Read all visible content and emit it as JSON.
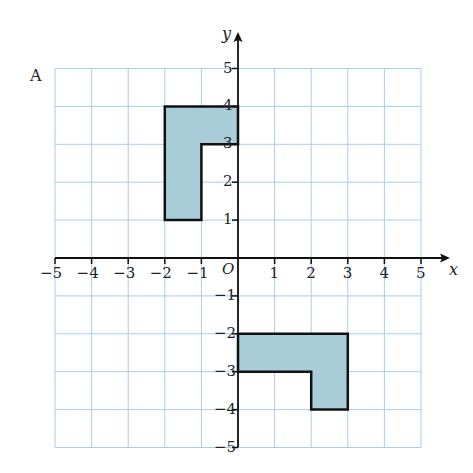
{
  "figure_label": "A",
  "axes": {
    "x_label": "x",
    "y_label": "y",
    "origin_label": "O",
    "x_ticks": [
      "−5",
      "−4",
      "−3",
      "−2",
      "−1",
      "1",
      "2",
      "3",
      "4",
      "5"
    ],
    "y_ticks": [
      "5",
      "4",
      "3",
      "2",
      "1",
      "−1",
      "−2",
      "−3",
      "−4",
      "−5"
    ],
    "x_range": [
      -5,
      5
    ],
    "y_range": [
      -5,
      5
    ]
  },
  "shapes": [
    {
      "name": "L-shape upper left",
      "vertices": [
        [
          -2,
          4
        ],
        [
          0,
          4
        ],
        [
          0,
          3
        ],
        [
          -1,
          3
        ],
        [
          -1,
          1
        ],
        [
          -2,
          1
        ]
      ]
    },
    {
      "name": "L-shape lower right",
      "vertices": [
        [
          0,
          -2
        ],
        [
          3,
          -2
        ],
        [
          3,
          -4
        ],
        [
          2,
          -4
        ],
        [
          2,
          -3
        ],
        [
          0,
          -3
        ]
      ]
    }
  ],
  "colors": {
    "grid": "#a8cdef",
    "fill": "#a9cdd8",
    "stroke": "#111111"
  }
}
